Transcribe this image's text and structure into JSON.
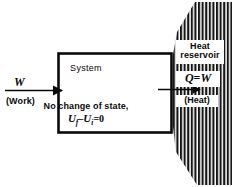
{
  "figure": {
    "colors": {
      "ink": "#0a0a0a",
      "background": "#ffffff",
      "hatch": "#1a1a1a"
    }
  },
  "system": {
    "label": "System",
    "state_note": "No change of state,",
    "energy_equation": {
      "u_symbol": "U",
      "final_subscript": "f",
      "minus": "–",
      "initial_subscript": "i",
      "equals": "=",
      "value": "0",
      "plain": "Uf - Ui = 0"
    }
  },
  "work_input": {
    "symbol": "W",
    "caption": "(Work)",
    "direction": "right",
    "arrow_name": "work-arrow"
  },
  "reservoir": {
    "name_line_1": "Heat",
    "name_line_2": "reservoir",
    "heat_equation": {
      "q_symbol": "Q",
      "equals": "=",
      "w_symbol": "W",
      "plain": "Q = W"
    },
    "heat_caption": "(Heat)",
    "direction": "right",
    "arrow_name": "heat-arrow",
    "fill_style": "vertical-hatching"
  }
}
